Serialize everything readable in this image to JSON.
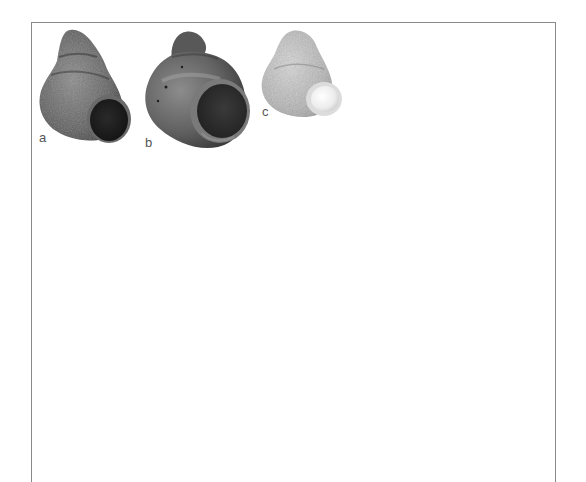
{
  "figure": {
    "frame_color": "#8a8a8a",
    "panels": [
      {
        "label": "a",
        "subject": "gastropod shell, rough granular surface, dark aperture"
      },
      {
        "label": "b",
        "subject": "gastropod shell, smooth glossy surface, open aperture"
      },
      {
        "label": "c",
        "subject": "gastropod shell, pale mottled surface, white aperture"
      }
    ]
  }
}
